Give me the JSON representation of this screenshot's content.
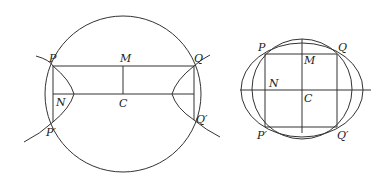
{
  "figures": [
    {
      "name": "hyperbola-figure",
      "labels": {
        "P": "P",
        "Q": "Q",
        "M": "M",
        "N": "N",
        "C": "C",
        "Pp": "P′",
        "Qp": "Q′"
      }
    },
    {
      "name": "ellipse-figure",
      "labels": {
        "P": "P",
        "Q": "Q",
        "M": "M",
        "N": "N",
        "C": "C",
        "Pp": "P′",
        "Qp": "Q′"
      }
    }
  ],
  "colors": {
    "stroke": "#333333",
    "text": "#222222",
    "background": "#ffffff"
  }
}
